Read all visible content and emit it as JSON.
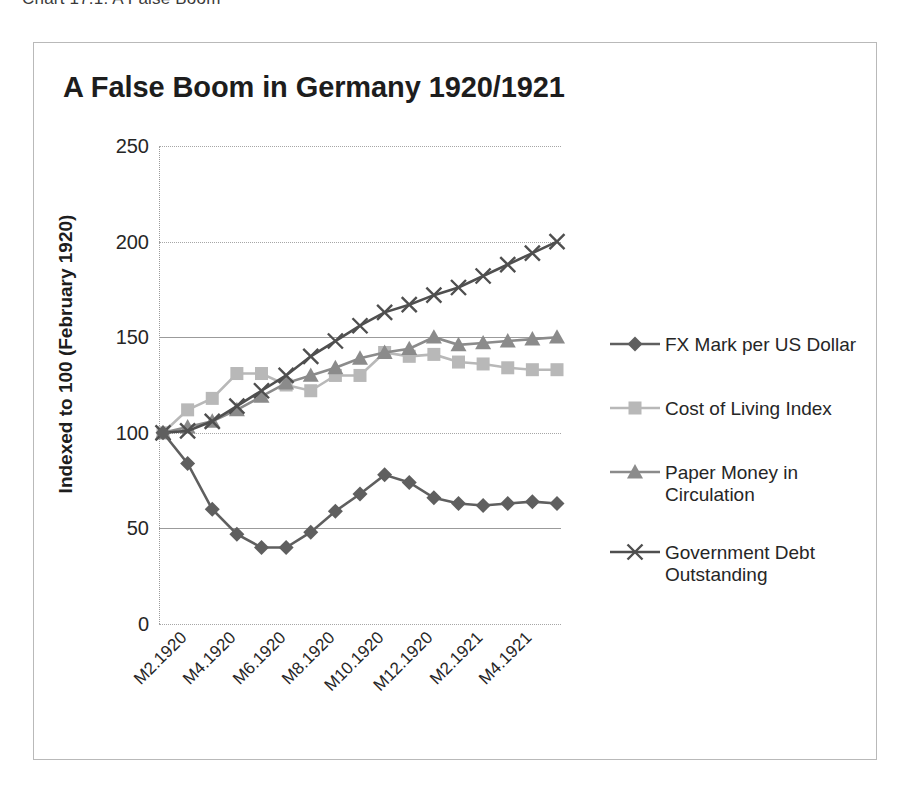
{
  "caption": "Chart 17.1: A False Boom",
  "chart_data": {
    "type": "line",
    "title": "A False Boom in Germany 1920/1921",
    "xlabel": "",
    "ylabel": "Indexed to 100 (February 1920)",
    "ylim": [
      0,
      250
    ],
    "yticks": [
      0,
      50,
      100,
      150,
      200,
      250
    ],
    "ytick_labels": [
      "0",
      "50",
      "100",
      "150",
      "200",
      "250"
    ],
    "grid": true,
    "legend_position": "right",
    "x": [
      "M2.1920",
      "M3.1920",
      "M4.1920",
      "M5.1920",
      "M6.1920",
      "M7.1920",
      "M8.1920",
      "M9.1920",
      "M10.1920",
      "M11.1920",
      "M12.1920",
      "M1.1921",
      "M2.1921",
      "M3.1921",
      "M4.1921",
      "M5.1921",
      "M6.1921"
    ],
    "xtick_labels": [
      "M2.1920",
      "M4.1920",
      "M6.1920",
      "M8.1920",
      "M10.1920",
      "M12.1920",
      "M2.1921",
      "M4.1921"
    ],
    "xtick_indices": [
      0,
      2,
      4,
      6,
      8,
      10,
      12,
      14
    ],
    "series": [
      {
        "name": "FX Mark per US Dollar",
        "marker": "diamond",
        "color": "#5f5f5f",
        "values": [
          100,
          84,
          60,
          47,
          40,
          40,
          48,
          59,
          68,
          78,
          74,
          66,
          63,
          62,
          63,
          64,
          63
        ]
      },
      {
        "name": "Cost of Living Index",
        "marker": "square",
        "color": "#b8b8b8",
        "values": [
          100,
          112,
          118,
          131,
          131,
          125,
          122,
          130,
          130,
          142,
          140,
          141,
          137,
          136,
          134,
          133,
          133
        ]
      },
      {
        "name": "Paper Money in Circulation",
        "marker": "triangle",
        "color": "#8b8b8b",
        "values": [
          100,
          103,
          106,
          112,
          119,
          126,
          130,
          134,
          139,
          142,
          144,
          150,
          146,
          147,
          148,
          149,
          150
        ]
      },
      {
        "name": "Government Debt Outstanding",
        "marker": "x",
        "color": "#4f4f4f",
        "values": [
          100,
          101,
          106,
          114,
          122,
          130,
          140,
          148,
          156,
          163,
          167,
          172,
          176,
          182,
          188,
          194,
          200
        ]
      }
    ]
  }
}
